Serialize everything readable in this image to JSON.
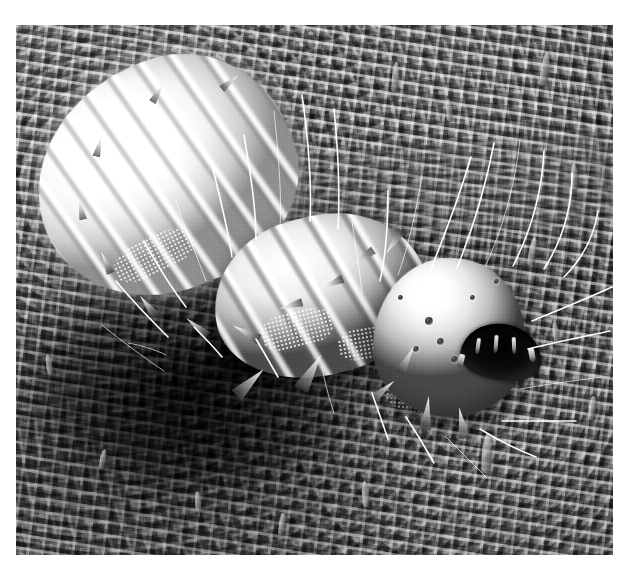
{
  "image": {
    "kind": "scanning-electron-micrograph",
    "modality": "SEM",
    "coloration": "grayscale",
    "frame": {
      "left_px": 16,
      "top_px": 25,
      "width_px": 597,
      "height_px": 530
    },
    "canvas": {
      "width_px": 637,
      "height_px": 576,
      "background_color": "#ffffff"
    },
    "palette": {
      "paper_white": "#ffffff",
      "specimen_highlight": "#ffffff",
      "specimen_midtone": "#c0c0c0",
      "substrate_grey": "#6e6e6e",
      "shadow_black": "#050505"
    },
    "subject": {
      "common_name": "caterpillar larva",
      "description": "Lepidopteran caterpillar larva resting on a leaf surface",
      "orientation": "head at lower right, abdomen trailing to upper left",
      "parts": [
        {
          "name": "head-capsule",
          "note": "rounded domed sclerotised capsule with stemmata pits"
        },
        {
          "name": "mouthparts",
          "note": "dark recessed oral cavity with mandibles and palps"
        },
        {
          "name": "thoracic-segments",
          "note": "segmented, bearing conical spines and thoracic legs"
        },
        {
          "name": "abdominal-segments",
          "note": "overexposed bright annulated segments"
        },
        {
          "name": "setae",
          "note": "long curved sensory hairs radiating outward"
        },
        {
          "name": "scoli-spines",
          "note": "short conical cuticular spines along segment margins"
        },
        {
          "name": "prolegs",
          "note": "ventral prolegs in shadow beneath body"
        }
      ]
    },
    "substrate": {
      "name": "leaf-surface",
      "description": "Plant epidermis with labyrinthine epicuticular wax reticulum",
      "features": [
        {
          "name": "wax-reticulum",
          "note": "vermiform ridged wax network covering the cuticle"
        },
        {
          "name": "trichomes",
          "note": "finger-like papillae / short trichomes projecting from surface"
        },
        {
          "name": "vein-striation",
          "note": "parallel striated band crossing the upper right field"
        }
      ]
    },
    "annotations": {
      "scale_bar": null,
      "label_text": null,
      "magnification": null
    },
    "setae_paths": [
      "M455,132 C443,172 428,212 414,246",
      "M478,118 C470,160 456,206 441,243",
      "M504,114 C500,156 488,200 470,240",
      "M528,126 C526,166 515,206 497,241",
      "M556,148 C556,184 546,216 528,244",
      "M406,150 C400,188 392,222 382,250",
      "M372,166 C372,200 370,230 364,256",
      "M582,186 C578,212 566,234 548,252",
      "M336,196 C340,224 344,248 346,268",
      "M318,84  C322,124 324,166 322,204",
      "M286,70  C292,112 296,154 294,196",
      "M258,86  C262,126 266,166 264,204",
      "M228,110 C234,146 240,182 240,214",
      "M196,140 C204,172 212,204 216,232",
      "M160,176 C170,206 182,234 190,256",
      "M128,216 C142,242 158,266 170,282",
      "M100,256 C118,278 138,298 152,312",
      "M86,300  C108,318 130,334 148,346",
      "M596,262 C570,274 540,286 516,296",
      "M594,306 C566,312 536,318 512,324",
      "M586,352 C556,356 526,360 504,364",
      "M560,396 C534,396 506,396 486,396",
      "M520,432 C500,424 480,414 464,404",
      "M470,452 C456,438 442,424 430,412",
      "M418,438 C408,420 398,404 390,392",
      "M372,414 C366,396 360,380 356,368",
      "M318,388 C312,370 308,354 306,342",
      "M262,352 C254,338 246,324 240,314",
      "M206,332 C196,320 186,310 178,302",
      "M150,330 C138,324 124,320 112,318"
    ]
  }
}
